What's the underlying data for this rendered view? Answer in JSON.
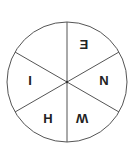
{
  "diagram": {
    "type": "wheel",
    "segments": 6,
    "stroke_color": "#555555",
    "labels": [
      {
        "position": "top-right",
        "text": "E",
        "transform": "mirrored"
      },
      {
        "position": "right",
        "text": "N",
        "transform": "none"
      },
      {
        "position": "bottom-right",
        "text": "W",
        "transform": "rotated"
      },
      {
        "position": "bottom-left",
        "text": "H",
        "transform": "none"
      },
      {
        "position": "left",
        "text": "I",
        "transform": "none"
      },
      {
        "position": "top-left",
        "text": "",
        "transform": "none"
      }
    ]
  }
}
